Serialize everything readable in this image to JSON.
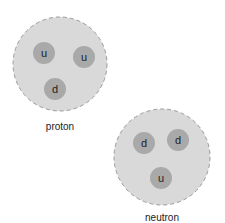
{
  "particles": [
    {
      "name": "proton",
      "label": "proton",
      "cx": 60,
      "cy": 64,
      "r": 47,
      "label_x": 60,
      "label_y": 120,
      "quarks": [
        {
          "flavor": "u",
          "cx": 44,
          "cy": 53
        },
        {
          "flavor": "u",
          "cx": 84,
          "cy": 57
        },
        {
          "flavor": "d",
          "cx": 55,
          "cy": 89
        }
      ]
    },
    {
      "name": "neutron",
      "label": "neutron",
      "cx": 162,
      "cy": 157,
      "r": 48,
      "label_x": 162,
      "label_y": 212,
      "quarks": [
        {
          "flavor": "d",
          "cx": 144,
          "cy": 143
        },
        {
          "flavor": "d",
          "cx": 178,
          "cy": 140
        },
        {
          "flavor": "u",
          "cx": 161,
          "cy": 178
        }
      ]
    }
  ],
  "quark_radius": 11,
  "colors": {
    "nucleon_fill": "#d9d9d9",
    "nucleon_stroke": "#9a9a9a",
    "quark_fill": "#a9a9a9",
    "text": "#222222"
  }
}
